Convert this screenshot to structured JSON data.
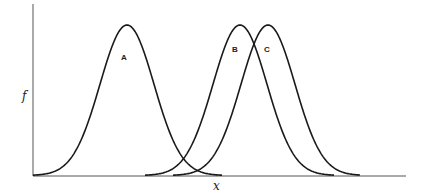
{
  "chart_data": {
    "type": "line",
    "title": "",
    "xlabel": "x",
    "ylabel": "f",
    "grid": false,
    "legend": "none",
    "series": [
      {
        "name": "A",
        "mean": 127,
        "sd": 27,
        "peak": 1.0,
        "x_start": 33,
        "x_end": 222
      },
      {
        "name": "B",
        "mean": 240,
        "sd": 27,
        "peak": 1.0,
        "x_start": 145,
        "x_end": 334
      },
      {
        "name": "C",
        "mean": 268,
        "sd": 27,
        "peak": 1.0,
        "x_start": 173,
        "x_end": 360
      }
    ],
    "annotations": [
      {
        "text": "A",
        "x": 124,
        "y": 58
      },
      {
        "text": "B",
        "x": 235,
        "y": 50
      },
      {
        "text": "C",
        "x": 267,
        "y": 50
      }
    ]
  },
  "labels": {
    "x": "x",
    "y": "f",
    "a": "A",
    "b": "B",
    "c": "C"
  },
  "colors": {
    "line": "#1a1a1a",
    "axis": "#555555"
  }
}
